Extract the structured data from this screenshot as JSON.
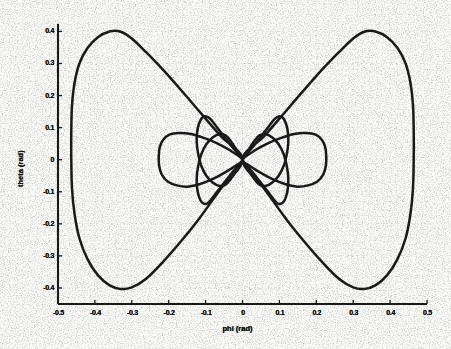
{
  "figure": {
    "background_color": "#fdfdfc",
    "ink_color": "#151515",
    "grid_color": "#9a9a9a"
  },
  "axes": {
    "x_label": "phi (rad)",
    "y_label": "theta (rad)",
    "x_ticks": [
      "-0.5",
      "-0.4",
      "-0.3",
      "-0.2",
      "-0.1",
      "0",
      "0.1",
      "0.2",
      "0.3",
      "0.4",
      "0.5"
    ],
    "y_ticks": [
      "0.4",
      "0.3",
      "0.2",
      "0.1",
      "0",
      "-0.1",
      "-0.2",
      "-0.3",
      "-0.4"
    ],
    "spines": "left-and-bottom",
    "grid": "dotted"
  },
  "chart_data": {
    "type": "line",
    "title": "",
    "xlabel": "phi (rad)",
    "ylabel": "theta (rad)",
    "xlim": [
      -0.5,
      0.5
    ],
    "ylim": [
      -0.45,
      0.42
    ],
    "grid": true,
    "legend": null,
    "xtick_values": [
      -0.5,
      -0.4,
      -0.3,
      -0.2,
      -0.1,
      0,
      0.1,
      0.2,
      0.3,
      0.4,
      0.5
    ],
    "ytick_values": [
      0.4,
      0.3,
      0.2,
      0.1,
      0,
      -0.1,
      -0.2,
      -0.3,
      -0.4
    ],
    "series": [
      {
        "name": "outer-figure-eight-left-lobe",
        "comment": "Large left lobe of outer separatrix, crosses origin, extends to phi=-0.46, theta +/-0.40",
        "points": [
          [
            0.0,
            0.0
          ],
          [
            -0.06,
            0.075
          ],
          [
            -0.115,
            0.148
          ],
          [
            -0.165,
            0.215
          ],
          [
            -0.215,
            0.28
          ],
          [
            -0.262,
            0.336
          ],
          [
            -0.3,
            0.378
          ],
          [
            -0.33,
            0.399
          ],
          [
            -0.36,
            0.4
          ],
          [
            -0.392,
            0.382
          ],
          [
            -0.42,
            0.348
          ],
          [
            -0.442,
            0.3
          ],
          [
            -0.455,
            0.24
          ],
          [
            -0.462,
            0.17
          ],
          [
            -0.464,
            0.09
          ],
          [
            -0.464,
            0.0
          ],
          [
            -0.462,
            -0.09
          ],
          [
            -0.455,
            -0.17
          ],
          [
            -0.442,
            -0.245
          ],
          [
            -0.42,
            -0.31
          ],
          [
            -0.392,
            -0.36
          ],
          [
            -0.36,
            -0.392
          ],
          [
            -0.33,
            -0.403
          ],
          [
            -0.3,
            -0.398
          ],
          [
            -0.262,
            -0.372
          ],
          [
            -0.215,
            -0.318
          ],
          [
            -0.165,
            -0.252
          ],
          [
            -0.115,
            -0.18
          ],
          [
            -0.06,
            -0.092
          ],
          [
            0.0,
            0.0
          ]
        ]
      },
      {
        "name": "outer-figure-eight-right-lobe",
        "comment": "Large right lobe of outer separatrix, mirror of left",
        "points": [
          [
            0.0,
            0.0
          ],
          [
            0.06,
            0.075
          ],
          [
            0.115,
            0.148
          ],
          [
            0.165,
            0.215
          ],
          [
            0.215,
            0.28
          ],
          [
            0.262,
            0.336
          ],
          [
            0.3,
            0.378
          ],
          [
            0.33,
            0.399
          ],
          [
            0.36,
            0.4
          ],
          [
            0.392,
            0.382
          ],
          [
            0.42,
            0.348
          ],
          [
            0.442,
            0.3
          ],
          [
            0.455,
            0.24
          ],
          [
            0.462,
            0.17
          ],
          [
            0.464,
            0.09
          ],
          [
            0.464,
            0.0
          ],
          [
            0.462,
            -0.09
          ],
          [
            0.455,
            -0.17
          ],
          [
            0.442,
            -0.245
          ],
          [
            0.42,
            -0.31
          ],
          [
            0.392,
            -0.36
          ],
          [
            0.36,
            -0.392
          ],
          [
            0.33,
            -0.403
          ],
          [
            0.3,
            -0.398
          ],
          [
            0.262,
            -0.372
          ],
          [
            0.215,
            -0.318
          ],
          [
            0.165,
            -0.252
          ],
          [
            0.115,
            -0.18
          ],
          [
            0.06,
            -0.092
          ],
          [
            0.0,
            0.0
          ]
        ]
      },
      {
        "name": "horizontal-lobe-left",
        "comment": "Inner horizontal left lobe, extends to phi=-0.225, half-height ~0.082",
        "points": [
          [
            0.0,
            0.0
          ],
          [
            -0.035,
            0.03
          ],
          [
            -0.07,
            0.052
          ],
          [
            -0.105,
            0.068
          ],
          [
            -0.14,
            0.08
          ],
          [
            -0.172,
            0.083
          ],
          [
            -0.198,
            0.078
          ],
          [
            -0.215,
            0.062
          ],
          [
            -0.224,
            0.04
          ],
          [
            -0.227,
            0.012
          ],
          [
            -0.226,
            -0.018
          ],
          [
            -0.219,
            -0.046
          ],
          [
            -0.203,
            -0.068
          ],
          [
            -0.178,
            -0.08
          ],
          [
            -0.148,
            -0.084
          ],
          [
            -0.115,
            -0.076
          ],
          [
            -0.08,
            -0.06
          ],
          [
            -0.045,
            -0.038
          ],
          [
            -0.018,
            -0.018
          ],
          [
            0.0,
            0.0
          ]
        ]
      },
      {
        "name": "horizontal-lobe-right",
        "comment": "Inner horizontal right lobe, extends to phi=+0.225",
        "points": [
          [
            0.0,
            0.0
          ],
          [
            0.035,
            0.03
          ],
          [
            0.07,
            0.052
          ],
          [
            0.105,
            0.068
          ],
          [
            0.14,
            0.08
          ],
          [
            0.172,
            0.083
          ],
          [
            0.198,
            0.078
          ],
          [
            0.215,
            0.062
          ],
          [
            0.224,
            0.04
          ],
          [
            0.227,
            0.012
          ],
          [
            0.226,
            -0.018
          ],
          [
            0.219,
            -0.046
          ],
          [
            0.203,
            -0.068
          ],
          [
            0.178,
            -0.08
          ],
          [
            0.148,
            -0.084
          ],
          [
            0.115,
            -0.076
          ],
          [
            0.08,
            -0.06
          ],
          [
            0.045,
            -0.038
          ],
          [
            0.018,
            -0.018
          ],
          [
            0.0,
            0.0
          ]
        ]
      },
      {
        "name": "vertical-lobe-upper-left",
        "comment": "Narrow upper-left vertical lobe, apex theta=+0.135 near phi=-0.085",
        "points": [
          [
            0.0,
            0.0
          ],
          [
            -0.028,
            0.04
          ],
          [
            -0.052,
            0.075
          ],
          [
            -0.072,
            0.105
          ],
          [
            -0.086,
            0.126
          ],
          [
            -0.098,
            0.135
          ],
          [
            -0.11,
            0.13
          ],
          [
            -0.118,
            0.112
          ],
          [
            -0.123,
            0.085
          ],
          [
            -0.124,
            0.052
          ],
          [
            -0.12,
            0.018
          ],
          [
            -0.112,
            -0.018
          ],
          [
            -0.098,
            -0.05
          ],
          [
            -0.08,
            -0.072
          ],
          [
            -0.062,
            -0.082
          ],
          [
            -0.046,
            -0.078
          ],
          [
            -0.032,
            -0.06
          ],
          [
            -0.018,
            -0.036
          ],
          [
            -0.008,
            -0.015
          ],
          [
            0.0,
            0.0
          ]
        ]
      },
      {
        "name": "vertical-lobe-upper-right",
        "comment": "Narrow upper-right vertical lobe, apex theta=+0.135 near phi=+0.085",
        "points": [
          [
            0.0,
            0.0
          ],
          [
            0.028,
            0.04
          ],
          [
            0.052,
            0.075
          ],
          [
            0.072,
            0.105
          ],
          [
            0.086,
            0.126
          ],
          [
            0.098,
            0.135
          ],
          [
            0.11,
            0.13
          ],
          [
            0.118,
            0.112
          ],
          [
            0.123,
            0.085
          ],
          [
            0.124,
            0.052
          ],
          [
            0.12,
            0.018
          ],
          [
            0.112,
            -0.018
          ],
          [
            0.098,
            -0.05
          ],
          [
            0.08,
            -0.072
          ],
          [
            0.062,
            -0.082
          ],
          [
            0.046,
            -0.078
          ],
          [
            0.032,
            -0.06
          ],
          [
            0.018,
            -0.036
          ],
          [
            0.008,
            -0.015
          ],
          [
            0.0,
            0.0
          ]
        ]
      },
      {
        "name": "vertical-lobe-lower-left",
        "comment": "Narrow lower-left vertical lobe, apex theta=-0.135 near phi=-0.085",
        "points": [
          [
            0.0,
            0.0
          ],
          [
            -0.028,
            -0.04
          ],
          [
            -0.052,
            -0.075
          ],
          [
            -0.072,
            -0.105
          ],
          [
            -0.086,
            -0.126
          ],
          [
            -0.098,
            -0.138
          ],
          [
            -0.11,
            -0.133
          ],
          [
            -0.118,
            -0.115
          ],
          [
            -0.123,
            -0.088
          ],
          [
            -0.124,
            -0.055
          ],
          [
            -0.12,
            -0.02
          ],
          [
            -0.112,
            0.016
          ],
          [
            -0.098,
            0.048
          ],
          [
            -0.08,
            0.07
          ],
          [
            -0.062,
            0.08
          ],
          [
            -0.046,
            0.076
          ],
          [
            -0.032,
            0.058
          ],
          [
            -0.018,
            0.034
          ],
          [
            -0.008,
            0.014
          ],
          [
            0.0,
            0.0
          ]
        ]
      },
      {
        "name": "vertical-lobe-lower-right",
        "comment": "Narrow lower-right vertical lobe, apex theta=-0.135 near phi=+0.085",
        "points": [
          [
            0.0,
            0.0
          ],
          [
            0.028,
            -0.04
          ],
          [
            0.052,
            -0.075
          ],
          [
            0.072,
            -0.105
          ],
          [
            0.086,
            -0.126
          ],
          [
            0.098,
            -0.138
          ],
          [
            0.11,
            -0.133
          ],
          [
            0.118,
            -0.115
          ],
          [
            0.123,
            -0.088
          ],
          [
            0.124,
            -0.055
          ],
          [
            0.12,
            -0.02
          ],
          [
            0.112,
            0.016
          ],
          [
            0.098,
            0.048
          ],
          [
            0.08,
            0.07
          ],
          [
            0.062,
            0.08
          ],
          [
            0.046,
            0.076
          ],
          [
            0.032,
            0.058
          ],
          [
            0.018,
            0.034
          ],
          [
            0.008,
            0.014
          ],
          [
            0.0,
            0.0
          ]
        ]
      }
    ]
  }
}
